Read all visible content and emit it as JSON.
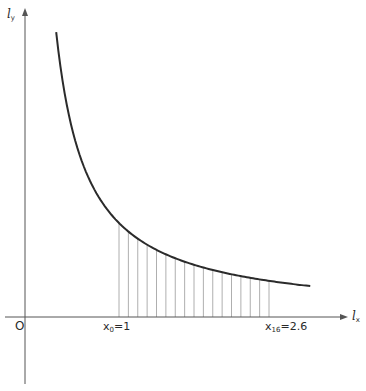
{
  "chart_data": {
    "type": "line",
    "title": "",
    "function": "y = 1/x (hyperbola) with shaded area under curve",
    "xlabel": "l_x",
    "ylabel": "l_y",
    "origin_label": "O",
    "x_range_curve": [
      0.33,
      3.04
    ],
    "shaded_interval": [
      1.0,
      2.6
    ],
    "partition_count": 16,
    "partition_points": [
      1.0,
      1.1,
      1.2,
      1.3,
      1.4,
      1.5,
      1.6,
      1.7,
      1.8,
      1.9,
      2.0,
      2.1,
      2.2,
      2.3,
      2.4,
      2.5,
      2.6
    ],
    "annotations": [
      {
        "x": 1.0,
        "text_main": "x",
        "text_sub": "0",
        "text_value": "=1"
      },
      {
        "x": 2.6,
        "text_main": "x",
        "text_sub": "16",
        "text_value": "=2.6"
      }
    ],
    "grid": false,
    "legend": null
  },
  "labels": {
    "y_axis_main": "l",
    "y_axis_sub": "y",
    "x_axis_main": "l",
    "x_axis_sub": "x",
    "origin": "O",
    "x0_main": "x",
    "x0_sub": "0",
    "x0_value": "=1",
    "x16_main": "x",
    "x16_sub": "16",
    "x16_value": "=2.6"
  },
  "colors": {
    "curve": "#2b2b2b",
    "axis": "#555555",
    "hatch": "#9a9a9a",
    "text": "#2a2a2a"
  }
}
